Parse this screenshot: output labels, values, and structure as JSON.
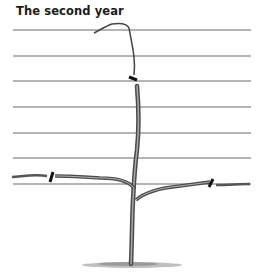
{
  "figure": {
    "title": "The second year",
    "wire_count": 7,
    "colors": {
      "ink": "#3a3a3a",
      "wire": "#6a6a6a",
      "ground": "#8a8a8a"
    }
  }
}
